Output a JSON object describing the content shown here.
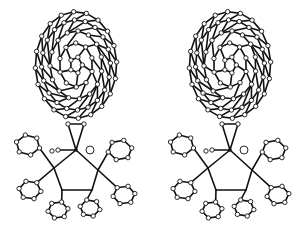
{
  "figure": {
    "type": "stereo-pair molecular structure",
    "views": [
      {
        "id": "left",
        "description": "C60 fullerene bound to metal center with diphosphine and phenyl rings (left eye view)"
      },
      {
        "id": "right",
        "description": "C60 fullerene bound to metal center with diphosphine and phenyl rings (right eye view)"
      }
    ],
    "colors": {
      "bond": "#111111",
      "atom_fill": "#ffffff",
      "background": "#ffffff"
    }
  }
}
